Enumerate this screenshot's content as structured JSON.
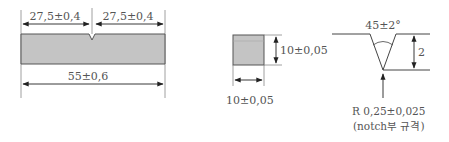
{
  "diagram": {
    "type": "charpy-impact-specimen-drawing",
    "colors": {
      "fill": "#c4c4c4",
      "line": "#444444",
      "text": "#555555"
    },
    "side_view": {
      "left_half_dim": "27,5±0,4",
      "right_half_dim": "27,5±0,4",
      "total_length_dim": "55±0,6"
    },
    "cross_section": {
      "height_dim": "10±0,05",
      "width_dim": "10±0,05"
    },
    "notch_detail": {
      "angle_dim": "45±2°",
      "depth_dim": "2",
      "radius_dim": "R 0,25±0,025",
      "note": "(notch부 규격)"
    }
  }
}
